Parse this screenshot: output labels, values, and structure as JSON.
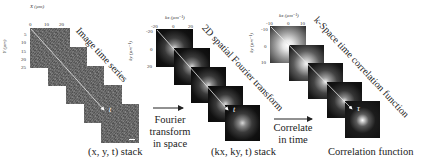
{
  "panels": [
    {
      "id": "image-time-series",
      "diagonal_label": "Image time series",
      "caption": "(x, y, t) stack",
      "x_axis": {
        "label": "X (µm)",
        "ticks": [
          "0",
          "10",
          "20"
        ]
      },
      "y_axis": {
        "label": "Y (µm)",
        "ticks": [
          "5",
          "10",
          "15",
          "20",
          "25"
        ]
      },
      "time_marker": "t",
      "frames": 5
    },
    {
      "id": "fourier-stack",
      "diagonal_label": "2D spatial Fourier transform",
      "caption": "(kx, ky, t) stack",
      "x_axis": {
        "label": "kx (µm⁻¹)",
        "ticks": [
          "-20",
          "0",
          "20"
        ]
      },
      "y_axis": {
        "label": "ky (µm⁻¹)",
        "ticks": [
          "-20",
          "0",
          "20"
        ]
      },
      "time_marker": "t",
      "frames": 5
    },
    {
      "id": "correlation-stack",
      "diagonal_label": "k-Space time correlation function",
      "caption": "Correlation function",
      "x_axis": {
        "label": "kx (µm⁻¹)",
        "ticks": [
          "-10",
          "0",
          "10"
        ]
      },
      "y_axis": {
        "label": "ky (µm⁻¹)",
        "ticks": [
          "-10",
          "0",
          "10"
        ]
      },
      "time_marker": "τ",
      "frames": 5
    }
  ],
  "operations": [
    {
      "id": "fourier",
      "lines": [
        "Fourier",
        "transform",
        "in space"
      ]
    },
    {
      "id": "correlate",
      "lines": [
        "Correlate",
        "in time"
      ]
    }
  ]
}
